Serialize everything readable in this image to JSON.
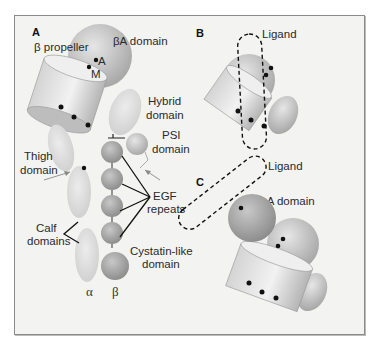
{
  "figure": {
    "panels": [
      {
        "id": "A",
        "labels": {
          "beta_propeller": "β propeller",
          "betaA_domain": "βA domain",
          "site_A": "A",
          "site_M": "M",
          "hybrid_domain_line1": "Hybrid",
          "hybrid_domain_line2": "domain",
          "psi_domain_line1": "PSI",
          "psi_domain_line2": "domain",
          "thigh_domain_line1": "Thigh",
          "thigh_domain_line2": "domain",
          "egf_repeats_line1": "EGF",
          "egf_repeats_line2": "repeats",
          "calf_domains_line1": "Calf",
          "calf_domains_line2": "domains",
          "cystatin_line1": "Cystatin-like",
          "cystatin_line2": "domain",
          "alpha_chain": "α",
          "beta_chain": "β"
        }
      },
      {
        "id": "B",
        "labels": {
          "ligand": "Ligand"
        }
      },
      {
        "id": "C",
        "labels": {
          "ligand": "Ligand",
          "alphaA_domain": "αA domain"
        }
      }
    ],
    "colors": {
      "background": "#f3f3f2",
      "frame": "#8a8a8a",
      "alpha_subunit": "#dcdcdc",
      "beta_subunit": "#b8b8b8",
      "dots": "#111111"
    }
  }
}
